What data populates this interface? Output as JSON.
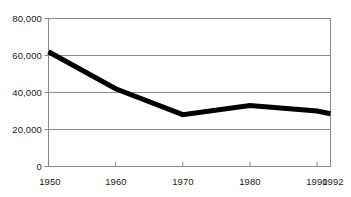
{
  "chart_data": {
    "type": "line",
    "title": "",
    "subtitle": "",
    "xlabel": "",
    "ylabel": "",
    "x": [
      1950,
      1960,
      1970,
      1980,
      1990,
      1992
    ],
    "categories": [
      "1950",
      "1960",
      "1970",
      "1980",
      "1990",
      "1992"
    ],
    "values": [
      62000,
      42000,
      28000,
      33000,
      30000,
      28500
    ],
    "series": [
      {
        "name": "series-1",
        "values": [
          62000,
          42000,
          28000,
          33000,
          30000,
          28500
        ],
        "color": "#000000",
        "line_width": 5
      }
    ],
    "xlim": [
      1950,
      1992
    ],
    "ylim": [
      0,
      80000
    ],
    "yticks": [
      0,
      20000,
      40000,
      60000,
      80000
    ],
    "ytick_labels": [
      "0",
      "20,000",
      "40,000",
      "60,000",
      "80,000"
    ],
    "xticks": [
      1950,
      1960,
      1970,
      1980,
      1990,
      1992
    ],
    "xtick_labels": [
      "1950",
      "1960",
      "1970",
      "1980",
      "1990",
      "1992"
    ],
    "grid": {
      "horizontal": true,
      "vertical": false,
      "color": "#808080"
    },
    "legend": {
      "visible": false,
      "position": "none",
      "entries": []
    },
    "axis_color": "#808080",
    "plot_background": "#ffffff"
  },
  "axis": {
    "y_labels": [
      {
        "text": "80,000",
        "value": 80000
      },
      {
        "text": "60,000",
        "value": 60000
      },
      {
        "text": "40,000",
        "value": 40000
      },
      {
        "text": "20,000",
        "value": 20000
      },
      {
        "text": "0",
        "value": 0
      }
    ],
    "x_labels": [
      {
        "text": "1950",
        "value": 1950
      },
      {
        "text": "1960",
        "value": 1960
      },
      {
        "text": "1970",
        "value": 1970
      },
      {
        "text": "1980",
        "value": 1980
      },
      {
        "text": "1990",
        "value": 1990
      },
      {
        "text": "1992",
        "value": 1992
      }
    ]
  }
}
